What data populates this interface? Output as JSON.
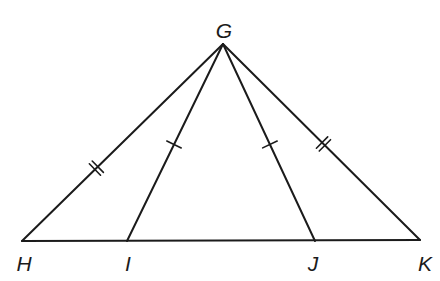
{
  "figure": {
    "kind": "geometry-diagram",
    "background_color": "#ffffff",
    "stroke_color": "#1b1b1b",
    "stroke_width": 2,
    "tick_color": "#1b1b1b",
    "tick_width": 1.6,
    "label_color": "#1b1b1b",
    "canvas": {
      "width": 440,
      "height": 281
    },
    "points": [
      {
        "id": "G",
        "label": "G",
        "x": 223,
        "y": 44,
        "label_x": 224,
        "label_y": 30
      },
      {
        "id": "H",
        "label": "H",
        "x": 22,
        "y": 241,
        "label_x": 24,
        "label_y": 263
      },
      {
        "id": "I",
        "label": "I",
        "x": 127,
        "y": 241,
        "label_x": 128,
        "label_y": 263
      },
      {
        "id": "J",
        "label": "J",
        "x": 315,
        "y": 241,
        "label_x": 313,
        "label_y": 263
      },
      {
        "id": "K",
        "label": "K",
        "x": 420,
        "y": 240,
        "label_x": 425,
        "label_y": 263
      }
    ],
    "segments": [
      {
        "id": "HK",
        "name": "base-segment-HK",
        "from": "H",
        "to": "K",
        "ticks": 0
      },
      {
        "id": "HG",
        "name": "segment-HG",
        "from": "H",
        "to": "G",
        "ticks": 2,
        "tick_t": 0.37
      },
      {
        "id": "GI",
        "name": "cevian-segment-GI",
        "from": "G",
        "to": "I",
        "ticks": 1,
        "tick_t": 0.51
      },
      {
        "id": "GJ",
        "name": "cevian-segment-GJ",
        "from": "G",
        "to": "J",
        "ticks": 1,
        "tick_t": 0.51
      },
      {
        "id": "GK",
        "name": "segment-GK",
        "from": "G",
        "to": "K",
        "ticks": 2,
        "tick_t": 0.51
      }
    ],
    "tick_geometry": {
      "half_length": 8,
      "double_spacing": 4
    },
    "congruence_groups": [
      {
        "ticks": 1,
        "segments": [
          "GI",
          "GJ"
        ]
      },
      {
        "ticks": 2,
        "segments": [
          "HG",
          "GK"
        ]
      }
    ]
  }
}
